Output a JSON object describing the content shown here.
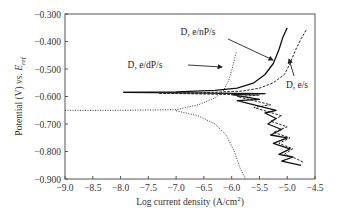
{
  "chart_data": {
    "type": "line",
    "title": "",
    "xlabel": "Log current density (A/cm²)",
    "xlabel_parts": {
      "main": "Log current density (A/cm",
      "sup": "2",
      "end": ")"
    },
    "ylabel": "Potential (V) vs. E_ref",
    "ylabel_parts": {
      "main": "Potential (V) vs. ",
      "italic": "E",
      "sub": "ref"
    },
    "xlim": [
      -9.0,
      -4.5
    ],
    "ylim": [
      -0.9,
      -0.3
    ],
    "x_ticks": [
      "-9.0",
      "-8.5",
      "-8.0",
      "-7.5",
      "-7.0",
      "-6.5",
      "-6.0",
      "-5.5",
      "-5.0",
      "-4.5"
    ],
    "y_ticks": [
      "-0.300",
      "-0.400",
      "-0.500",
      "-0.600",
      "-0.700",
      "-0.800",
      "-0.900"
    ],
    "grid": false,
    "legend": "annotations with arrows",
    "series": [
      {
        "name": "D, e/dP/s",
        "style": "dotted",
        "anodic": [
          [
            -9.0,
            -0.65
          ],
          [
            -8.0,
            -0.65
          ],
          [
            -7.0,
            -0.648
          ],
          [
            -6.6,
            -0.63
          ],
          [
            -6.3,
            -0.605
          ],
          [
            -6.15,
            -0.58
          ],
          [
            -6.05,
            -0.54
          ],
          [
            -5.98,
            -0.49
          ],
          [
            -5.92,
            -0.44
          ]
        ],
        "cathodic": [
          [
            -7.0,
            -0.652
          ],
          [
            -6.6,
            -0.67
          ],
          [
            -6.3,
            -0.7
          ],
          [
            -6.1,
            -0.74
          ],
          [
            -5.95,
            -0.8
          ],
          [
            -5.85,
            -0.86
          ],
          [
            -5.75,
            -0.9
          ]
        ]
      },
      {
        "name": "D, e/nP/s",
        "style": "solid",
        "anodic": [
          [
            -7.95,
            -0.585
          ],
          [
            -7.0,
            -0.583
          ],
          [
            -6.3,
            -0.578
          ],
          [
            -5.9,
            -0.57
          ],
          [
            -5.6,
            -0.55
          ],
          [
            -5.4,
            -0.52
          ],
          [
            -5.25,
            -0.48
          ],
          [
            -5.15,
            -0.43
          ],
          [
            -5.08,
            -0.385
          ],
          [
            -5.0,
            -0.35
          ]
        ],
        "cathodic_sawtooth": [
          [
            -7.95,
            -0.585
          ],
          [
            -5.4,
            -0.59
          ],
          [
            -6.0,
            -0.593
          ],
          [
            -5.5,
            -0.61
          ],
          [
            -5.9,
            -0.615
          ],
          [
            -5.2,
            -0.65
          ],
          [
            -5.4,
            -0.66
          ],
          [
            -5.2,
            -0.68
          ],
          [
            -5.35,
            -0.7
          ],
          [
            -5.1,
            -0.72
          ],
          [
            -5.3,
            -0.74
          ],
          [
            -5.0,
            -0.75
          ],
          [
            -5.25,
            -0.77
          ],
          [
            -4.95,
            -0.79
          ],
          [
            -5.15,
            -0.81
          ],
          [
            -4.9,
            -0.82
          ],
          [
            -5.1,
            -0.835
          ],
          [
            -4.75,
            -0.85
          ]
        ]
      },
      {
        "name": "D, e/s",
        "style": "dashed",
        "anodic": [
          [
            -7.3,
            -0.588
          ],
          [
            -6.5,
            -0.586
          ],
          [
            -5.8,
            -0.58
          ],
          [
            -5.5,
            -0.57
          ],
          [
            -5.25,
            -0.55
          ],
          [
            -5.05,
            -0.52
          ],
          [
            -4.95,
            -0.48
          ],
          [
            -4.85,
            -0.43
          ],
          [
            -4.75,
            -0.39
          ],
          [
            -4.65,
            -0.355
          ]
        ],
        "cathodic_sawtooth": [
          [
            -7.3,
            -0.588
          ],
          [
            -5.5,
            -0.595
          ],
          [
            -5.9,
            -0.6
          ],
          [
            -5.3,
            -0.63
          ],
          [
            -5.6,
            -0.64
          ],
          [
            -5.1,
            -0.67
          ],
          [
            -5.3,
            -0.69
          ],
          [
            -5.0,
            -0.71
          ],
          [
            -5.25,
            -0.73
          ],
          [
            -4.95,
            -0.75
          ],
          [
            -5.15,
            -0.77
          ],
          [
            -4.9,
            -0.79
          ],
          [
            -5.05,
            -0.81
          ],
          [
            -4.85,
            -0.825
          ],
          [
            -4.7,
            -0.84
          ]
        ]
      }
    ],
    "annotations": [
      {
        "text": "D, e/nP/s",
        "target_series": "D, e/nP/s"
      },
      {
        "text": "D, e/dP/s",
        "target_series": "D, e/dP/s"
      },
      {
        "text": "D, e/s",
        "target_series": "D, e/s"
      }
    ]
  },
  "plot": {
    "left_px": 65,
    "right_px": 315,
    "top_px": 14,
    "bottom_px": 179
  }
}
